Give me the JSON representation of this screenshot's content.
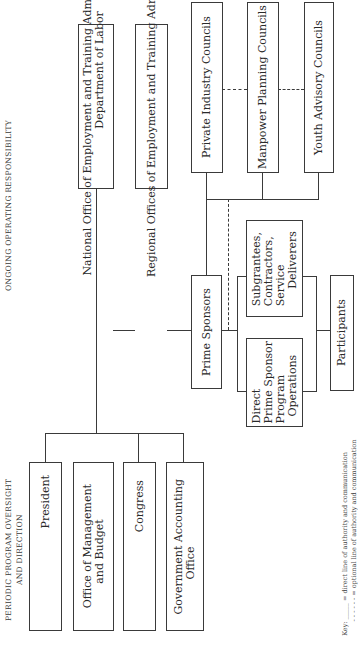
{
  "sections": {
    "ongoing": "Ongoing operating responsibility",
    "periodic": "Periodic program oversight\nand direction"
  },
  "boxes": {
    "national_office": "National Office of Employment and Training Administration,\n                                          Department of Labor",
    "regional_offices": "Regional Offices of Employment and Training Administration",
    "prime_sponsors": "Prime Sponsors",
    "private_industry": "Private Industry Councils",
    "manpower_planning": "Manpower Planning Councils",
    "youth_advisory": "Youth Advisory Councils",
    "subgrantees": "Subgrantees,\nContractors,\nService\n     Deliverers",
    "direct_prime": "Direct\nPrime Sponsor\nProgram\n  Operations",
    "participants": "Participants",
    "president": "President",
    "omb": "Office of Management\n       and Budget",
    "congress": "Congress",
    "gao": "Government Accounting\n          Office"
  },
  "key": {
    "line1": "Key: _____ = direct line of authority and communication",
    "line2": "       - - - - - - = optional line of authority and communication"
  }
}
